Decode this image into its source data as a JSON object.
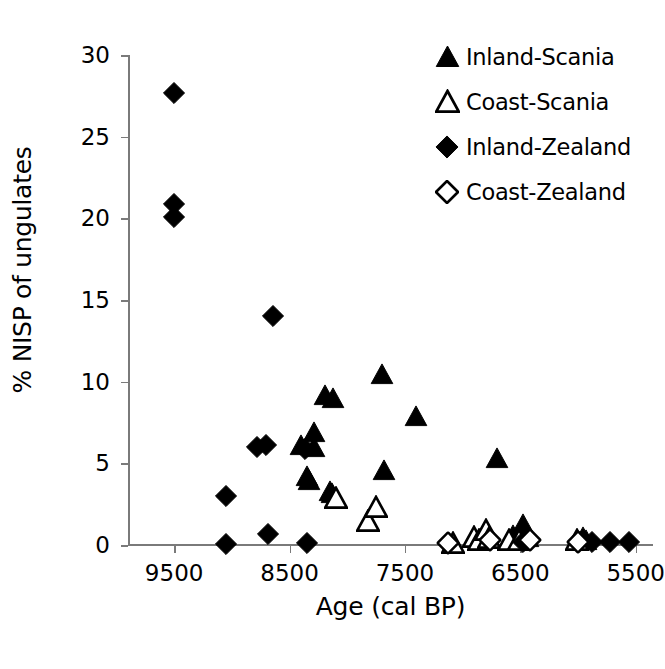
{
  "chart_data": {
    "type": "scatter",
    "title": "",
    "xlabel": "Age (cal BP)",
    "ylabel": "% NISP of ungulates",
    "xlim": [
      9900,
      5350
    ],
    "ylim": [
      0,
      30
    ],
    "x_reversed": true,
    "grid": false,
    "legend_position": "top-right",
    "xticks": [
      9500,
      8500,
      7500,
      6500,
      5500
    ],
    "xticklabels": [
      "9500",
      "8500",
      "7500",
      "6500",
      "5500"
    ],
    "yticks": [
      0,
      5,
      10,
      15,
      20,
      25,
      30
    ],
    "yticklabels": [
      "0",
      "5",
      "10",
      "15",
      "20",
      "25",
      "30"
    ],
    "series": [
      {
        "name": "Inland-Scania",
        "marker": "filled-triangle",
        "color": "#000000",
        "points": [
          {
            "x": 8350,
            "y": 4.2
          },
          {
            "x": 8330,
            "y": 4.0
          },
          {
            "x": 8400,
            "y": 6.1
          },
          {
            "x": 8290,
            "y": 6.9
          },
          {
            "x": 8290,
            "y": 6.0
          },
          {
            "x": 8190,
            "y": 9.2
          },
          {
            "x": 8120,
            "y": 9.0
          },
          {
            "x": 8150,
            "y": 3.3
          },
          {
            "x": 8130,
            "y": 3.2
          },
          {
            "x": 7700,
            "y": 10.5
          },
          {
            "x": 7680,
            "y": 4.6
          },
          {
            "x": 7400,
            "y": 7.9
          },
          {
            "x": 6700,
            "y": 5.3
          },
          {
            "x": 6560,
            "y": 0.6
          },
          {
            "x": 6480,
            "y": 1.3
          },
          {
            "x": 6430,
            "y": 0.5
          },
          {
            "x": 5960,
            "y": 0.5
          },
          {
            "x": 5930,
            "y": 0.3
          }
        ]
      },
      {
        "name": "Coast-Scania",
        "marker": "open-triangle",
        "color": "#000000",
        "points": [
          {
            "x": 8100,
            "y": 2.9
          },
          {
            "x": 7820,
            "y": 1.5
          },
          {
            "x": 7750,
            "y": 2.3
          },
          {
            "x": 7080,
            "y": 0.1
          },
          {
            "x": 6900,
            "y": 0.5
          },
          {
            "x": 6860,
            "y": 0.3
          },
          {
            "x": 6800,
            "y": 0.9
          },
          {
            "x": 6770,
            "y": 0.4
          },
          {
            "x": 6600,
            "y": 0.3
          },
          {
            "x": 6510,
            "y": 0.3
          },
          {
            "x": 6010,
            "y": 0.3
          }
        ]
      },
      {
        "name": "Inland-Zealand",
        "marker": "filled-diamond",
        "color": "#000000",
        "points": [
          {
            "x": 9500,
            "y": 27.7
          },
          {
            "x": 9500,
            "y": 20.9
          },
          {
            "x": 9500,
            "y": 20.1
          },
          {
            "x": 9050,
            "y": 3.0
          },
          {
            "x": 9050,
            "y": 0.05
          },
          {
            "x": 8780,
            "y": 6.0
          },
          {
            "x": 8700,
            "y": 6.1
          },
          {
            "x": 8690,
            "y": 0.7
          },
          {
            "x": 8640,
            "y": 14.0
          },
          {
            "x": 8370,
            "y": 5.9
          },
          {
            "x": 8350,
            "y": 0.1
          },
          {
            "x": 6480,
            "y": 0.2
          },
          {
            "x": 5880,
            "y": 0.2
          },
          {
            "x": 5720,
            "y": 0.2
          },
          {
            "x": 5560,
            "y": 0.2
          }
        ]
      },
      {
        "name": "Coast-Zealand",
        "marker": "open-diamond",
        "color": "#000000",
        "points": [
          {
            "x": 7130,
            "y": 0.15
          },
          {
            "x": 6760,
            "y": 0.3
          },
          {
            "x": 6420,
            "y": 0.3
          },
          {
            "x": 6000,
            "y": 0.2
          }
        ]
      }
    ]
  },
  "legend": {
    "items": [
      {
        "label": "Inland-Scania",
        "marker": "filled-triangle"
      },
      {
        "label": "Coast-Scania",
        "marker": "open-triangle"
      },
      {
        "label": "Inland-Zealand",
        "marker": "filled-diamond"
      },
      {
        "label": "Coast-Zealand",
        "marker": "open-diamond"
      }
    ]
  }
}
